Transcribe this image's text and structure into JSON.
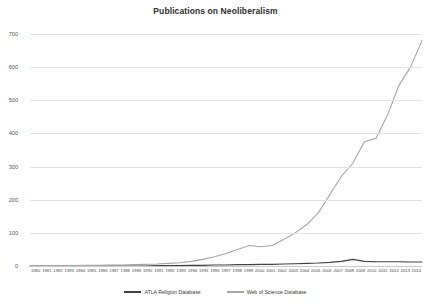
{
  "chart_data": {
    "type": "line",
    "title": "Publications on Neoliberalism",
    "xlabel": "",
    "ylabel": "",
    "ylim": [
      0,
      700
    ],
    "ytick_step": 100,
    "yticks": [
      0,
      100,
      200,
      300,
      400,
      500,
      600,
      700
    ],
    "grid": true,
    "legend_position": "bottom-center",
    "categories": [
      "1980",
      "1981",
      "1982",
      "1983",
      "1984",
      "1985",
      "1986",
      "1987",
      "1988",
      "1989",
      "1990",
      "1991",
      "1992",
      "1993",
      "1994",
      "1995",
      "1996",
      "1997",
      "1998",
      "1999",
      "2000",
      "2001",
      "2002",
      "2003",
      "2004",
      "2005",
      "2006",
      "2007",
      "2008",
      "2009",
      "2010",
      "2011",
      "2012",
      "2013",
      "2014"
    ],
    "series": [
      {
        "name": "ATLA Religion Database",
        "color": "#404040",
        "values": [
          0,
          0,
          0,
          0,
          0,
          0,
          0,
          0,
          0,
          0,
          0,
          1,
          1,
          1,
          2,
          2,
          3,
          3,
          4,
          4,
          5,
          5,
          6,
          7,
          8,
          9,
          11,
          14,
          20,
          14,
          13,
          13,
          13,
          12,
          12
        ]
      },
      {
        "name": "Web of Science Database",
        "color": "#a6a6a6",
        "values": [
          0,
          0,
          1,
          1,
          1,
          2,
          2,
          3,
          3,
          4,
          5,
          6,
          8,
          10,
          14,
          20,
          28,
          38,
          50,
          62,
          58,
          62,
          80,
          100,
          125,
          160,
          215,
          270,
          310,
          375,
          385,
          455,
          545,
          600,
          680
        ]
      }
    ]
  },
  "legend": {
    "entries": [
      {
        "label": "ATLA Religion Database"
      },
      {
        "label": "Web of Science Database"
      }
    ]
  }
}
